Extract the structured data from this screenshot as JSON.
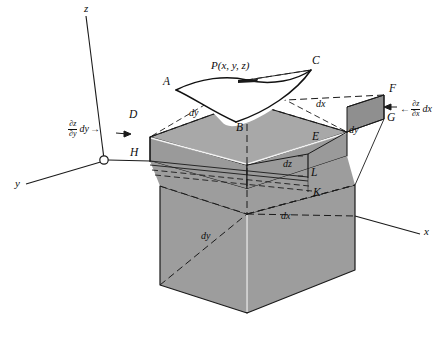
{
  "figure": {
    "kind": "geometry-diagram",
    "background_color": "#ffffff",
    "fill_color": "#9d9d9d",
    "top_face_color": "#a6a6a6",
    "line_color": "#1a1a1a",
    "highlight_color": "#f2f2f2"
  },
  "axes": [
    {
      "name": "z-axis",
      "label": "z",
      "x": 84,
      "y": 5
    },
    {
      "name": "y-axis",
      "label": "y",
      "x": 15,
      "y": 183
    },
    {
      "name": "x-axis",
      "label": "x",
      "x": 424,
      "y": 231
    }
  ],
  "origin": {
    "name": "origin-marker",
    "cx": 104,
    "cy": 160,
    "r": 4.2
  },
  "point_labels": [
    {
      "id": "P",
      "text": "P(x, y, z)",
      "x": 211,
      "y": 66,
      "kind": "point"
    },
    {
      "id": "A",
      "text": "A",
      "x": 165,
      "y": 82,
      "kind": "vertex"
    },
    {
      "id": "B",
      "text": "B",
      "x": 238,
      "y": 127,
      "kind": "vertex"
    },
    {
      "id": "C",
      "text": "C",
      "x": 313,
      "y": 60,
      "kind": "vertex"
    },
    {
      "id": "D",
      "text": "D",
      "x": 130,
      "y": 114,
      "kind": "vertex"
    },
    {
      "id": "E",
      "text": "E",
      "x": 312,
      "y": 135,
      "kind": "vertex"
    },
    {
      "id": "F",
      "text": "F",
      "x": 390,
      "y": 88,
      "kind": "vertex"
    },
    {
      "id": "G",
      "text": "G",
      "x": 388,
      "y": 117,
      "kind": "vertex"
    },
    {
      "id": "H",
      "text": "H",
      "x": 131,
      "y": 152,
      "kind": "vertex"
    },
    {
      "id": "K",
      "text": "K",
      "x": 314,
      "y": 192,
      "kind": "vertex"
    },
    {
      "id": "L",
      "text": "L",
      "x": 312,
      "y": 172,
      "kind": "vertex"
    }
  ],
  "dimension_labels": [
    {
      "id": "dy-top-left",
      "text": "dy",
      "x": 189,
      "y": 113,
      "kind": "dim"
    },
    {
      "id": "dx-top-right",
      "text": "dx",
      "x": 316,
      "y": 104,
      "kind": "dim"
    },
    {
      "id": "dy-right",
      "text": "dy",
      "x": 349,
      "y": 130,
      "kind": "dim"
    },
    {
      "id": "dz-front",
      "text": "dz",
      "x": 287,
      "y": 163,
      "kind": "dim"
    },
    {
      "id": "dx-bottom",
      "text": "dx",
      "x": 283,
      "y": 216,
      "kind": "dim"
    },
    {
      "id": "dy-bottom",
      "text": "dy",
      "x": 203,
      "y": 236,
      "kind": "dim"
    }
  ],
  "partial_labels": [
    {
      "id": "dz-dy-label",
      "numerator": "∂z",
      "denominator": "∂y",
      "tail": "dy",
      "arrow": "→",
      "arrow_side": "right",
      "x": 68,
      "y": 126
    },
    {
      "id": "dz-dx-label",
      "numerator": "∂z",
      "denominator": "∂x",
      "tail": "dx",
      "arrow": "←",
      "arrow_side": "left",
      "x": 398,
      "y": 98
    }
  ],
  "geometry": {
    "prism": {
      "top_face": "150,137 247,102 337,124 247,165",
      "top_face_note": "D-A'-E'-H' quadrilateral of the slab top",
      "left_face": "150,137 150,161 247,189 247,165",
      "front_face_lower": "160,285 160,186 247,214 247,313",
      "right_face_lower": "247,313 247,214 355,185 355,270"
    },
    "slab_edges": [
      {
        "name": "edge-D-H",
        "from": [
          150,
          137
        ],
        "to": [
          150,
          161
        ]
      },
      {
        "name": "edge-H-L",
        "from": [
          150,
          161
        ],
        "to": [
          308,
          177
        ]
      },
      {
        "name": "edge-E-L",
        "from": [
          308,
          154
        ],
        "to": [
          308,
          177
        ]
      },
      {
        "name": "edge-L-K",
        "from": [
          308,
          177
        ],
        "to": [
          308,
          190
        ]
      }
    ]
  },
  "surface_patch": {
    "name": "saddle-surface-patch",
    "corners": [
      "A",
      "B",
      "C"
    ],
    "apex": "P",
    "fill": "#ffffff",
    "outline": "#111111"
  }
}
